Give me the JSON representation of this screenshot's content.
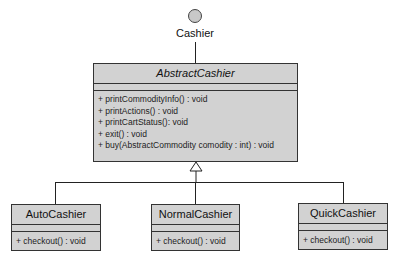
{
  "interface": {
    "name": "Cashier"
  },
  "abstract_class": {
    "name": "AbstractCashier",
    "attributes": [],
    "operations": [
      "+ printCommodityInfo() : void",
      "+ printActions() : void",
      "+ printCartStatus(): void",
      "+ exit() : void",
      "+ buy(AbstractCommodity comodity : int) : void"
    ]
  },
  "subclasses": [
    {
      "name": "AutoCashier",
      "operations": [
        "+ checkout() : void"
      ]
    },
    {
      "name": "NormalCashier",
      "operations": [
        "+ checkout() : void"
      ]
    },
    {
      "name": "QuickCashier",
      "operations": [
        "+ checkout() : void"
      ]
    }
  ],
  "colors": {
    "box_fill": "#d2d2d2",
    "border": "#333333",
    "background": "#ffffff"
  }
}
